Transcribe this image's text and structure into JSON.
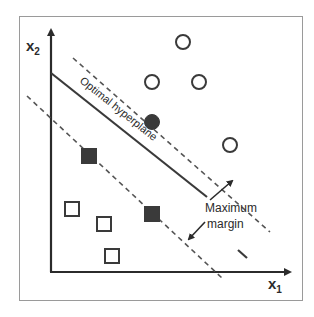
{
  "diagram": {
    "axes": {
      "x_label": "x",
      "x_sub": "1",
      "y_label": "x",
      "y_sub": "2"
    },
    "labels": {
      "hyperplane": "Optimal hyperplane",
      "margin_line1": "Maximum",
      "margin_line2": "margin"
    },
    "classes": {
      "circles": [
        {
          "x": 183,
          "y": 42,
          "filled": false
        },
        {
          "x": 152,
          "y": 82,
          "filled": false
        },
        {
          "x": 199,
          "y": 82,
          "filled": false
        },
        {
          "x": 152,
          "y": 122,
          "filled": true
        },
        {
          "x": 230,
          "y": 145,
          "filled": false
        }
      ],
      "squares": [
        {
          "x": 89,
          "y": 156,
          "filled": true
        },
        {
          "x": 152,
          "y": 214,
          "filled": true
        },
        {
          "x": 72,
          "y": 209,
          "filled": false
        },
        {
          "x": 104,
          "y": 224,
          "filled": false
        },
        {
          "x": 112,
          "y": 256,
          "filled": false
        }
      ]
    },
    "colors": {
      "ink": "#2b2b2b",
      "dash": "#555555",
      "frame": "#9a9a9a",
      "fill": "#3a3a3a"
    }
  }
}
